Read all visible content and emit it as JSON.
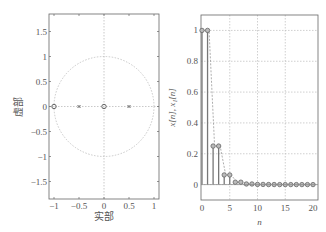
{
  "chart_data": [
    {
      "type": "scatter",
      "title": "",
      "subtype": "pole-zero plot",
      "xlabel": "实部",
      "ylabel": "虚部",
      "xlim": [
        -1.1,
        1.1
      ],
      "ylim": [
        -1.85,
        1.85
      ],
      "xticks": [
        -1,
        -0.5,
        0,
        0.5,
        1
      ],
      "xtick_labels": [
        "−1",
        "−0.5",
        "0",
        "0.5",
        "1"
      ],
      "yticks": [
        1.5,
        1,
        0.5,
        0,
        -0.5,
        -1,
        -1.5
      ],
      "ytick_labels": [
        "1.5",
        "1",
        "0.5",
        "0",
        "−0.5",
        "−1",
        "−1.5"
      ],
      "unit_circle": true,
      "grid": false,
      "zeros": [
        {
          "re": -1,
          "im": 0
        },
        {
          "re": 0,
          "im": 0
        }
      ],
      "poles": [
        {
          "re": -0.5,
          "im": 0
        },
        {
          "re": 0.5,
          "im": 0
        }
      ]
    },
    {
      "type": "stem",
      "title": "",
      "xlabel": "n",
      "ylabel": "x[n], x₁[n]",
      "xlim": [
        0,
        20
      ],
      "ylim": [
        -0.1,
        1.1
      ],
      "xticks": [
        0,
        5,
        10,
        15,
        20
      ],
      "yticks": [
        0,
        0.2,
        0.4,
        0.6,
        0.8,
        1
      ],
      "ytick_labels": [
        "0",
        "0.2",
        "0.4",
        "0.6",
        "0.8",
        "1"
      ],
      "grid": true,
      "x": [
        0,
        1,
        2,
        3,
        4,
        5,
        6,
        7,
        8,
        9,
        10,
        11,
        12,
        13,
        14,
        15,
        16,
        17,
        18,
        19,
        20
      ],
      "series": [
        {
          "name": "x[n]",
          "style": "solid stem, circle markers",
          "values": [
            1,
            1,
            0.25,
            0.25,
            0.0625,
            0.0625,
            0.0156,
            0.0156,
            0.0039,
            0.0039,
            0.001,
            0.001,
            0.0002,
            0.0002,
            0,
            0,
            0,
            0,
            0,
            0,
            0
          ]
        },
        {
          "name": "x₁[n]",
          "style": "dashed",
          "values": [
            1,
            1,
            0.25,
            0.25,
            0.0625,
            0.0625,
            0.0156,
            0.0156,
            0.0039,
            0.0039,
            0.001,
            0.001,
            0.0002,
            0.0002,
            0,
            0,
            0,
            0,
            0,
            0,
            0
          ]
        }
      ]
    }
  ]
}
